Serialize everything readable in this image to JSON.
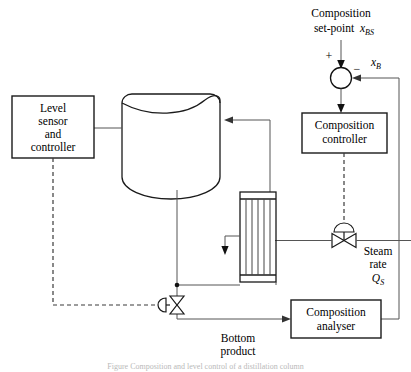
{
  "diagram": {
    "type": "process-flow-control-diagram",
    "blocks": [
      {
        "id": "level-controller",
        "lines": [
          "Level",
          "sensor",
          "and",
          "controller"
        ],
        "x": 12,
        "y": 96,
        "w": 82,
        "h": 62
      },
      {
        "id": "composition-controller",
        "lines": [
          "Composition",
          "controller"
        ],
        "x": 302,
        "y": 113,
        "w": 85,
        "h": 40
      },
      {
        "id": "composition-analyser",
        "lines": [
          "Composition",
          "analyser"
        ],
        "x": 291,
        "y": 300,
        "w": 90,
        "h": 38
      }
    ],
    "labels": {
      "set_point_text": "Composition",
      "set_point_text2": "set-point",
      "set_point_var": "x",
      "set_point_sub": "BS",
      "feedback_var": "x",
      "feedback_sub": "B",
      "plus_sign": "+",
      "minus_sign": "−",
      "steam_line1": "Steam",
      "steam_line2": "rate",
      "steam_var": "Q",
      "steam_sub": "S",
      "bottom_line1": "Bottom",
      "bottom_line2": "product"
    },
    "equipment": {
      "vessel_name": "distillation-column-vessel",
      "reboiler_name": "shell-and-tube-reboiler",
      "reboiler_tube_count": 5,
      "steam_valve_name": "steam-control-valve",
      "bottoms_valve_name": "bottoms-control-valve",
      "summing_junction_name": "summing-junction"
    },
    "colors": {
      "line": "#1a1a1a",
      "pipe": "#555555",
      "signal": "#3a3a3a",
      "background": "#ffffff"
    },
    "caption": "Figure  Composition and level control of a distillation column"
  }
}
